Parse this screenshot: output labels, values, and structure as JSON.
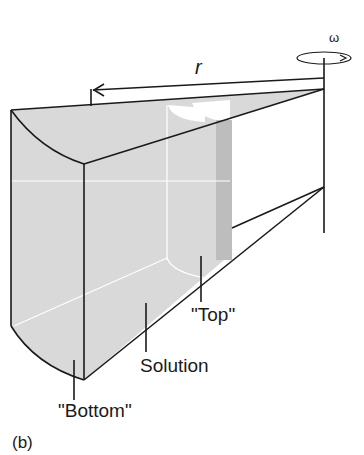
{
  "figure": {
    "panel_label": "(b)",
    "labels": {
      "radius": "r",
      "angular_velocity": "ω",
      "top": "\"Top\"",
      "solution": "Solution",
      "bottom": "\"Bottom\""
    },
    "colors": {
      "solution_fill": "#d9d9d9",
      "top_band_fill": "#bdbdbd",
      "line": "#1a1a1a",
      "background": "#ffffff"
    }
  }
}
